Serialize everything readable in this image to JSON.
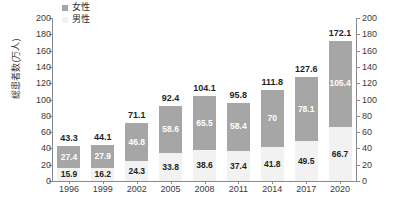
{
  "chart_data": {
    "type": "bar",
    "subtype": "stacked-column",
    "title": "",
    "xlabel": "",
    "ylabel": "総患者数(万人)",
    "ylim": [
      0,
      200
    ],
    "ytick_step": 20,
    "yticks": [
      0,
      20,
      40,
      60,
      80,
      100,
      120,
      140,
      160,
      180,
      200
    ],
    "dual_axis": true,
    "right_ylim": [
      0,
      200
    ],
    "right_yticks": [
      0,
      20,
      40,
      60,
      80,
      100,
      120,
      140,
      160,
      180,
      200
    ],
    "grid": false,
    "legend_position": "top-left",
    "categories": [
      "1996",
      "1999",
      "2002",
      "2005",
      "2008",
      "2011",
      "2014",
      "2017",
      "2020"
    ],
    "series": [
      {
        "name": "男性",
        "color": "#f2f2f2",
        "stack_order": "bottom",
        "values": [
          15.9,
          16.2,
          24.3,
          33.8,
          38.6,
          37.4,
          41.8,
          49.5,
          66.7
        ],
        "labels": [
          "15.9",
          "16.2",
          "24.3",
          "33.8",
          "38.6",
          "37.4",
          "41.8",
          "49.5",
          "66.7"
        ]
      },
      {
        "name": "女性",
        "color": "#a6a6a6",
        "stack_order": "top",
        "values": [
          27.4,
          27.9,
          46.8,
          58.6,
          65.5,
          58.4,
          70,
          78.1,
          105.4
        ],
        "labels": [
          "27.4",
          "27.9",
          "46.8",
          "58.6",
          "65.5",
          "58.4",
          "70",
          "78.1",
          "105.4"
        ]
      }
    ],
    "totals": [
      43.3,
      44.1,
      71.1,
      92.4,
      104.1,
      95.8,
      111.8,
      127.6,
      172.1
    ],
    "total_labels": [
      "43.3",
      "44.1",
      "71.1",
      "92.4",
      "104.1",
      "95.8",
      "111.8",
      "127.6",
      "172.1"
    ]
  },
  "legend": {
    "items": [
      {
        "label": "女性",
        "color": "#a6a6a6"
      },
      {
        "label": "男性",
        "color": "#f2f2f2"
      }
    ]
  },
  "axes": {
    "y_title": "総患者数(万人)"
  },
  "colors": {
    "female": "#a6a6a6",
    "male": "#f2f2f2",
    "axis": "#8a8a8a",
    "text": "#2b2b2b",
    "background": "#ffffff"
  }
}
